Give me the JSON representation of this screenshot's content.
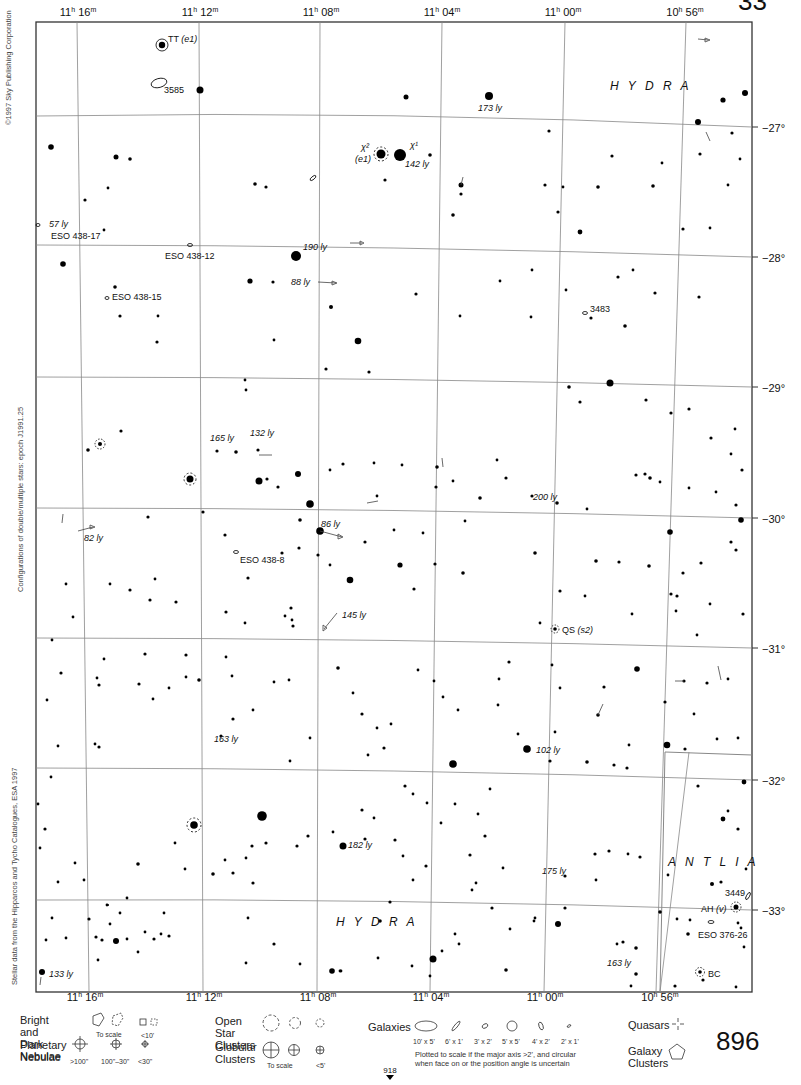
{
  "page": {
    "number": "896",
    "next_page_ref": "918",
    "top_page_fragment": "33",
    "credits": {
      "copyright": "©1997 Sky Publishing Corporation",
      "epoch_note": "Configurations of double/multiple stars: epoch J1991.25",
      "data_source": "Stellar data from the Hipparcos and Tycho Catalogues, ESA 1997"
    }
  },
  "map": {
    "frame": {
      "left": 36,
      "top": 22,
      "right": 752,
      "bottom": 992
    },
    "ra_labels_top": [
      {
        "text": "11h 16m",
        "x": 78
      },
      {
        "text": "11h 12m",
        "x": 200
      },
      {
        "text": "11h 08m",
        "x": 320
      },
      {
        "text": "11h 04m",
        "x": 442
      },
      {
        "text": "11h 00m",
        "x": 562
      },
      {
        "text": "10h 56m",
        "x": 685
      }
    ],
    "ra_labels_bottom": [
      {
        "text": "11h 16m",
        "x": 84
      },
      {
        "text": "11h 12m",
        "x": 203
      },
      {
        "text": "11h 08m",
        "x": 318
      },
      {
        "text": "11h 04m",
        "x": 430
      },
      {
        "text": "11h 00m",
        "x": 544
      },
      {
        "text": "10h 56m",
        "x": 660
      }
    ],
    "dec_labels": [
      {
        "text": "−27°",
        "y": 128
      },
      {
        "text": "−28°",
        "y": 257
      },
      {
        "text": "−29°",
        "y": 387
      },
      {
        "text": "−30°",
        "y": 518
      },
      {
        "text": "−31°",
        "y": 648
      },
      {
        "text": "−32°",
        "y": 780
      },
      {
        "text": "−33°",
        "y": 910
      }
    ],
    "constellations": [
      {
        "name": "H Y D R A",
        "x": 610,
        "y": 90
      },
      {
        "name": "H Y D R A",
        "x": 336,
        "y": 926
      },
      {
        "name": "A N T L I A",
        "x": 668,
        "y": 866
      }
    ],
    "labels": [
      {
        "text": "TT",
        "style": "normal",
        "x": 168,
        "y": 42
      },
      {
        "text": "(e1)",
        "style": "italic",
        "x": 180,
        "y": 42
      },
      {
        "text": "3585",
        "style": "normal",
        "x": 164,
        "y": 93
      },
      {
        "text": "173 ly",
        "style": "italic",
        "x": 478,
        "y": 111
      },
      {
        "text": "χ²",
        "style": "italic",
        "x": 358,
        "y": 150
      },
      {
        "text": "(e1)",
        "style": "italic",
        "x": 356,
        "y": 162
      },
      {
        "text": "χ¹",
        "style": "italic",
        "x": 410,
        "y": 148
      },
      {
        "text": "142 ly",
        "style": "italic",
        "x": 405,
        "y": 167
      },
      {
        "text": "57 ly",
        "style": "italic",
        "x": 49,
        "y": 226
      },
      {
        "text": "ESO 438-17",
        "style": "normal",
        "x": 51,
        "y": 238
      },
      {
        "text": "ESO 438-12",
        "style": "normal",
        "x": 165,
        "y": 258
      },
      {
        "text": "190 ly",
        "style": "italic",
        "x": 303,
        "y": 250
      },
      {
        "text": "88 ly",
        "style": "italic",
        "x": 291,
        "y": 285
      },
      {
        "text": "ESO 438-15",
        "style": "normal",
        "x": 112,
        "y": 299
      },
      {
        "text": "3483",
        "style": "normal",
        "x": 590,
        "y": 311
      },
      {
        "text": "165 ly",
        "style": "italic",
        "x": 210,
        "y": 440
      },
      {
        "text": "132 ly",
        "style": "italic",
        "x": 250,
        "y": 436
      },
      {
        "text": "200 ly",
        "style": "italic",
        "x": 533,
        "y": 500
      },
      {
        "text": "86 ly",
        "style": "italic",
        "x": 321,
        "y": 527
      },
      {
        "text": "82 ly",
        "style": "italic",
        "x": 84,
        "y": 541
      },
      {
        "text": "ESO 438-8",
        "style": "normal",
        "x": 240,
        "y": 562
      },
      {
        "text": "145 ly",
        "style": "italic",
        "x": 342,
        "y": 618
      },
      {
        "text": "QS",
        "style": "normal",
        "x": 562,
        "y": 633
      },
      {
        "text": "(s2)",
        "style": "italic",
        "x": 576,
        "y": 633
      },
      {
        "text": "163 ly",
        "style": "italic",
        "x": 214,
        "y": 742
      },
      {
        "text": "102 ly",
        "style": "italic",
        "x": 536,
        "y": 753
      },
      {
        "text": "182 ly",
        "style": "italic",
        "x": 348,
        "y": 848
      },
      {
        "text": "175 ly",
        "style": "italic",
        "x": 542,
        "y": 874
      },
      {
        "text": "3449",
        "style": "normal",
        "x": 725,
        "y": 896
      },
      {
        "text": "AH",
        "style": "normal",
        "x": 701,
        "y": 911
      },
      {
        "text": "(v)",
        "style": "italic",
        "x": 719,
        "y": 911
      },
      {
        "text": "ESO 376-26",
        "style": "normal",
        "x": 698,
        "y": 938
      },
      {
        "text": "163 ly",
        "style": "italic",
        "x": 607,
        "y": 966
      },
      {
        "text": "BC",
        "style": "normal",
        "x": 708,
        "y": 976
      },
      {
        "text": "133 ly",
        "style": "italic",
        "x": 49,
        "y": 976
      }
    ]
  },
  "legend": {
    "nebulae": {
      "label": "Bright and Dark\nNebulae",
      "captions": [
        "To scale",
        "<10'"
      ]
    },
    "planetary": {
      "label": "Planetary\nNebulae",
      "captions": [
        ">100\"",
        "100\"–30\"",
        "<30\""
      ]
    },
    "open_clusters": {
      "label": "Open Star\nClusters"
    },
    "globular": {
      "label": "Globular\nClusters",
      "captions": [
        "To scale",
        "<5'"
      ]
    },
    "galaxies": {
      "label": "Galaxies",
      "sizes": [
        "10' x 5'",
        "6' x 1'",
        "3' x 2'",
        "5' x 5'",
        "4' x 2'",
        "2' x 1'"
      ],
      "note": "Plotted to scale if the major axis >2', and circular\nwhen face on or the position angle is uncertain"
    },
    "quasars": {
      "label": "Quasars"
    },
    "galaxy_clusters": {
      "label": "Galaxy\nClusters"
    }
  }
}
